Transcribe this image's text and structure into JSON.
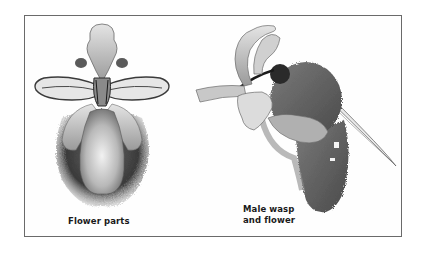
{
  "figure": {
    "panels": [
      {
        "id": "flower",
        "caption": "Flower parts"
      },
      {
        "id": "wasp",
        "caption_line1": "Male wasp",
        "caption_line2": "and flower"
      }
    ]
  },
  "colors": {
    "frame_border": "#6a6a6a",
    "background": "#ffffff",
    "petal_light": "#d8d8d8",
    "petal_mid": "#a8a8a8",
    "fur_dark": "#3a3a3a"
  }
}
